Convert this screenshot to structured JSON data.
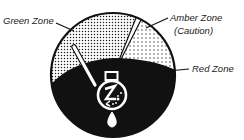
{
  "diagram": {
    "labels": {
      "green_zone": "Green Zone",
      "amber_zone": "Amber Zone",
      "amber_zone_note": "(Caution)",
      "red_zone": "Red Zone"
    },
    "icon": "thermometer-flask-icon",
    "colors": {
      "ink": "#111111",
      "paper": "#ffffff"
    }
  }
}
